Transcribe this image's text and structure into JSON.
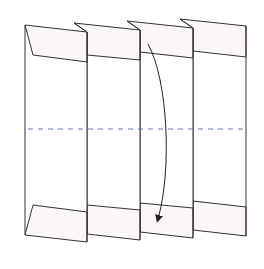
{
  "diagram": {
    "colors": {
      "background": "#ffffff",
      "stroke": "#333333",
      "flap_fill": "#fbf6f8",
      "panel_fill": "#ffffff",
      "dashed_line": "#6677bb",
      "arrow": "#222222"
    },
    "panels": [
      {
        "name": "panel-1",
        "top": [
          [
            25,
            25
          ],
          [
            87,
            32
          ]
        ],
        "bottom": [
          [
            25,
            235
          ],
          [
            87,
            242
          ]
        ],
        "top_fold": [
          [
            33,
            55
          ],
          [
            87,
            62
          ]
        ],
        "bottom_fold": [
          [
            33,
            205
          ],
          [
            87,
            212
          ]
        ]
      },
      {
        "name": "panel-2",
        "top": [
          [
            74,
            23
          ],
          [
            140,
            30
          ]
        ],
        "bottom": [
          [
            87,
            234
          ],
          [
            140,
            240
          ]
        ],
        "top_fold": [
          [
            87,
            55
          ],
          [
            140,
            60
          ]
        ],
        "bottom_fold": [
          [
            87,
            205
          ],
          [
            140,
            210
          ]
        ]
      },
      {
        "name": "panel-3",
        "top": [
          [
            127,
            21
          ],
          [
            193,
            28
          ]
        ],
        "bottom": [
          [
            140,
            232
          ],
          [
            193,
            238
          ]
        ],
        "top_fold": [
          [
            140,
            52
          ],
          [
            193,
            58
          ]
        ],
        "bottom_fold": [
          [
            140,
            203
          ],
          [
            193,
            208
          ]
        ]
      },
      {
        "name": "panel-4",
        "top": [
          [
            180,
            19
          ],
          [
            246,
            26
          ]
        ],
        "bottom": [
          [
            193,
            230
          ],
          [
            246,
            236
          ]
        ],
        "top_fold": [
          [
            193,
            51
          ],
          [
            246,
            57
          ]
        ],
        "bottom_fold": [
          [
            193,
            201
          ],
          [
            246,
            207
          ]
        ]
      }
    ],
    "fold_line": {
      "y": 129,
      "x_start": 28,
      "x_end": 246,
      "style": "dashed"
    },
    "arrow": {
      "description": "curved arrow indicating folding top down",
      "start": [
        148,
        44
      ],
      "end": [
        158,
        221
      ]
    }
  }
}
